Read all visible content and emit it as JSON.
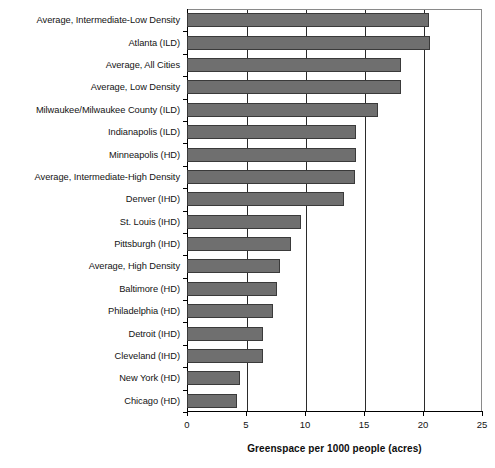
{
  "chart_data": {
    "type": "bar",
    "orientation": "horizontal",
    "title": "",
    "xlabel": "Greenspace per 1000 people (acres)",
    "ylabel": "",
    "xlim": [
      0,
      25
    ],
    "xticks": [
      "0",
      "5",
      "10",
      "15",
      "20",
      "25"
    ],
    "grid": "vertical",
    "legend": "none",
    "bar_color": "#6f6f6f",
    "bar_edge_color": "#3a3a3a",
    "categories": [
      "Average, Intermediate-Low Density",
      "Atlanta (ILD)",
      "Average, All Cities",
      "Average, Low Density",
      "Milwaukee/Milwaukee County (ILD)",
      "Indianapolis (ILD)",
      "Minneapolis (HD)",
      "Average, Intermediate-High Density",
      "Denver (IHD)",
      "St. Louis (IHD)",
      "Pittsburgh (IHD)",
      "Average, High Density",
      "Baltimore (HD)",
      "Philadelphia (HD)",
      "Detroit (IHD)",
      "Cleveland (IHD)",
      "New York (HD)",
      "Chicago (HD)"
    ],
    "values": [
      20.5,
      20.6,
      18.1,
      18.1,
      16.2,
      14.3,
      14.3,
      14.2,
      13.3,
      9.7,
      8.8,
      7.9,
      7.6,
      7.3,
      6.4,
      6.4,
      4.5,
      4.2
    ]
  }
}
